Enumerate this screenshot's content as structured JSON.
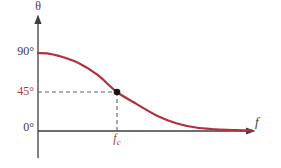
{
  "figure": {
    "background": "#ffffff",
    "axis_color": "#3e3e40",
    "curve_color": "#b22f3f",
    "dashed_color": "#636363",
    "dot_color": "#161616",
    "red_label_color": "#b5393f",
    "dark_label_color": "#3c3c3e"
  },
  "chart_data": {
    "type": "line",
    "xlabel": "f",
    "ylabel": "θ",
    "xlim": [
      0,
      2.7
    ],
    "ylim": [
      0,
      130
    ],
    "grid": false,
    "legend": false,
    "y_ticks": [
      {
        "label": "90°",
        "value": 90,
        "color": "dark"
      },
      {
        "label": "45°",
        "value": 45,
        "color": "red"
      },
      {
        "label": "0°",
        "value": 0,
        "color": "dark"
      }
    ],
    "x_ticks": [
      {
        "label": "f_c",
        "base": "f",
        "sub": "c",
        "value": 1,
        "color": "red"
      }
    ],
    "annotations": [
      {
        "type": "point_with_dashed_guides",
        "x": 1,
        "y": 45
      }
    ],
    "series": [
      {
        "name": "phase-angle-vs-frequency",
        "points": [
          [
            0,
            90
          ],
          [
            0.12,
            89.5
          ],
          [
            0.25,
            87
          ],
          [
            0.5,
            79
          ],
          [
            0.75,
            65
          ],
          [
            1,
            45
          ],
          [
            1.25,
            31
          ],
          [
            1.5,
            18
          ],
          [
            1.75,
            9
          ],
          [
            2,
            4
          ],
          [
            2.25,
            2
          ],
          [
            2.5,
            1
          ],
          [
            2.7,
            0.7
          ]
        ]
      }
    ]
  }
}
